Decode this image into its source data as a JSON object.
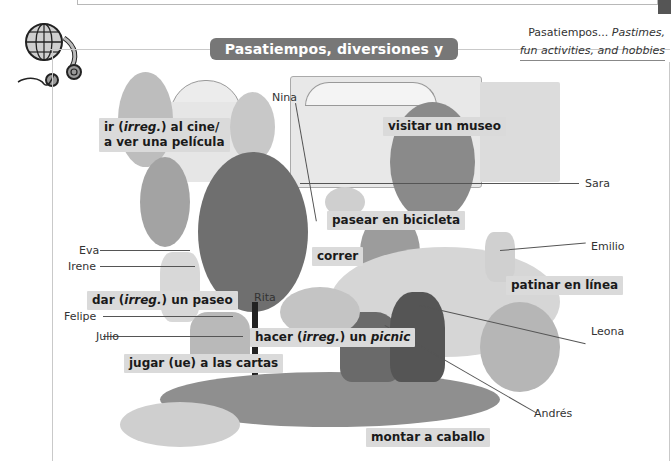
{
  "header": {
    "title": "Pasatiempos, diversiones y aficiones°",
    "gloss_term": "Pasatiempos...",
    "gloss_line1": "Pastimes,",
    "gloss_line2": "fun activities, and hobbies"
  },
  "icons": {
    "corner": "globe-headphones-icon"
  },
  "colors": {
    "title_pill": "#777777",
    "label_bg": "#dadada",
    "frame": "#c9c9c9",
    "tab": "#555555"
  },
  "vocab": {
    "cine_1": "ir (",
    "cine_irreg": "irreg.",
    "cine_2": ") al cine/",
    "cine_3": "a ver una película",
    "museo": "visitar un museo",
    "bicicleta": "pasear en bicicleta",
    "correr": "correr",
    "paseo_1": "dar (",
    "paseo_irreg": "irreg.",
    "paseo_2": ") un paseo",
    "picnic_1": "hacer (",
    "picnic_irreg": "irreg.",
    "picnic_2": ") un ",
    "picnic_3": "picnic",
    "cartas": "jugar (ue) a las cartas",
    "patinar": "patinar en línea",
    "caballo": "montar a caballo"
  },
  "names": {
    "nina": "Nina",
    "sara": "Sara",
    "eva": "Eva",
    "irene": "Irene",
    "emilio": "Emilio",
    "rita": "Rita",
    "felipe": "Felipe",
    "julio": "Julio",
    "leona": "Leona",
    "andres": "Andrés"
  }
}
